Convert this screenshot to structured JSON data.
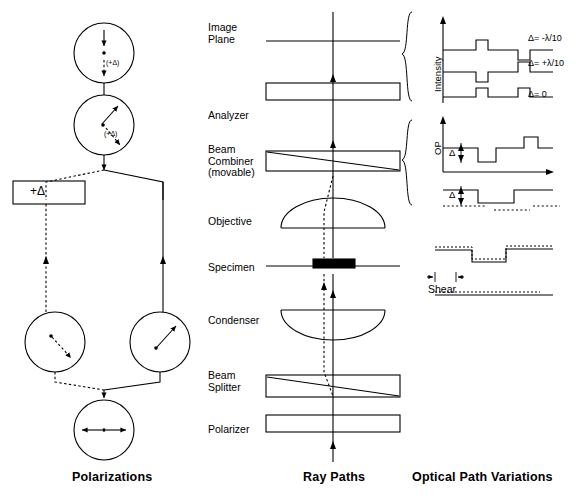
{
  "figure": {
    "title_bottom_captions": [
      {
        "id": "polarizations",
        "label": "Polarizations",
        "x": 72,
        "y": 470
      },
      {
        "id": "ray-paths",
        "label": "Ray Paths",
        "x": 303,
        "y": 470
      },
      {
        "id": "optical-path-variations",
        "label": "Optical Path Variations",
        "x": 412,
        "y": 470
      }
    ]
  },
  "columns": {
    "left": {
      "name": "Polarizations",
      "box_label": "+Δ",
      "circles": [
        {
          "id": "top-vertical",
          "label": "(+Δ)",
          "cx": 104,
          "cy": 53,
          "r": 30,
          "arrow": "vertical-double"
        },
        {
          "id": "diagonal",
          "label": "(+Δ)",
          "cx": 104,
          "cy": 125,
          "r": 30,
          "arrow": "diagonal-double"
        },
        {
          "id": "lower-left",
          "label": "",
          "cx": 55,
          "cy": 342,
          "r": 30,
          "arrow": "diagonal-dashed"
        },
        {
          "id": "lower-right",
          "label": "",
          "cx": 160,
          "cy": 342,
          "r": 30,
          "arrow": "diagonal-solid"
        },
        {
          "id": "bottom-horizontal",
          "label": "",
          "cx": 104,
          "cy": 430,
          "r": 30,
          "arrow": "horizontal-double"
        }
      ]
    },
    "middle": {
      "name": "Ray Paths",
      "elements": [
        {
          "id": "image-plane",
          "label": "Image\nPlane",
          "label_x": 208,
          "label_y": 22,
          "y": 41,
          "type": "plane"
        },
        {
          "id": "analyzer",
          "label": "Analyzer",
          "label_x": 208,
          "label_y": 110,
          "y": 92,
          "type": "slab"
        },
        {
          "id": "beam-combiner",
          "label": "Beam\nCombiner\n(movable)",
          "label_x": 208,
          "label_y": 144,
          "y": 160,
          "type": "slab-diagonal"
        },
        {
          "id": "objective",
          "label": "Objective",
          "label_x": 208,
          "label_y": 216,
          "y": 216,
          "type": "lens-up"
        },
        {
          "id": "specimen",
          "label": "Specimen",
          "label_x": 208,
          "label_y": 262,
          "y": 266,
          "type": "specimen"
        },
        {
          "id": "condenser",
          "label": "Condenser",
          "label_x": 208,
          "label_y": 315,
          "y": 318,
          "type": "lens-down"
        },
        {
          "id": "beam-splitter",
          "label": "Beam\nSplitter",
          "label_x": 208,
          "label_y": 370,
          "y": 384,
          "type": "slab-diagonal"
        },
        {
          "id": "polarizer",
          "label": "Polarizer",
          "label_x": 208,
          "label_y": 424,
          "y": 424,
          "type": "slab"
        }
      ]
    },
    "right": {
      "name": "Optical Path Variations",
      "groups": [
        {
          "id": "intensity-group",
          "axis_label": "Intensity",
          "traces": [
            {
              "id": "trace-minus",
              "label": "Δ= -λ/10",
              "y": 50
            },
            {
              "id": "trace-plus",
              "label": "Δ= +λ/10",
              "y": 72
            },
            {
              "id": "trace-zero",
              "label": "Δ= 0",
              "y": 97
            }
          ]
        },
        {
          "id": "op-group",
          "axis_label": "OP",
          "traces": [
            {
              "id": "op-trace-1",
              "label": "Δ",
              "y": 150
            },
            {
              "id": "op-trace-2",
              "label": "Δ",
              "y": 190
            }
          ]
        },
        {
          "id": "shear-group",
          "axis_label": "",
          "shear_label": "Shear",
          "traces": [
            {
              "id": "shear-trace-1",
              "label": "",
              "y": 250
            },
            {
              "id": "shear-trace-2",
              "label": "",
              "y": 295
            }
          ]
        }
      ]
    }
  },
  "colors": {
    "stroke": "#000000",
    "background": "#ffffff"
  }
}
